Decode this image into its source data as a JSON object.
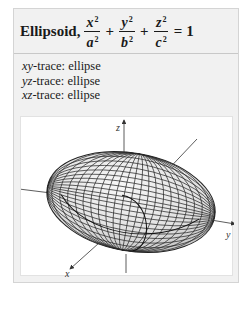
{
  "card": {
    "title_word": "Ellipsoid,",
    "equation": {
      "terms": [
        {
          "num": "x",
          "num_exp": "2",
          "den": "a",
          "den_exp": "2"
        },
        {
          "num": "y",
          "num_exp": "2",
          "den": "b",
          "den_exp": "2"
        },
        {
          "num": "z",
          "num_exp": "2",
          "den": "c",
          "den_exp": "2"
        }
      ],
      "plus": "+",
      "equals": "=",
      "rhs": "1"
    },
    "traces": [
      {
        "plane": "xy",
        "suffix": "-trace: ellipse"
      },
      {
        "plane": "yz",
        "suffix": "-trace: ellipse"
      },
      {
        "plane": "xz",
        "suffix": "-trace: ellipse"
      }
    ]
  },
  "figure": {
    "axis_labels": {
      "x": "x",
      "y": "y",
      "z": "z"
    },
    "colors": {
      "surface_light": "#f4f4f4",
      "surface_dark": "#c4c4c4",
      "grid": "#2a2a2a",
      "axis": "#333333"
    }
  }
}
